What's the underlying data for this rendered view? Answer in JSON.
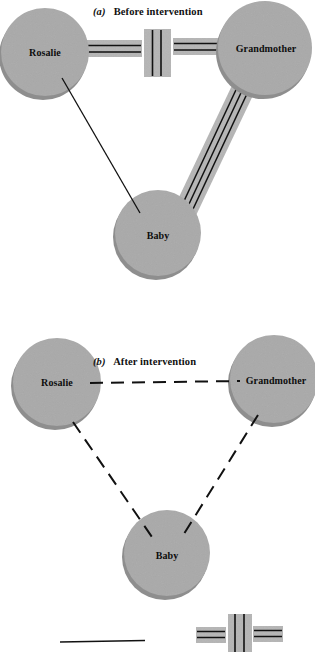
{
  "figure": {
    "background_color": "#ffffff",
    "node_fill_color": "#a9a9a9",
    "node_shadow_color": "#8e8e8e",
    "band_fill_color": "#b5b5b5",
    "line_color": "#111111"
  },
  "panels": [
    {
      "id": "before",
      "caption_letter": "(a)",
      "caption_text": "Before intervention",
      "nodes": [
        {
          "name": "rosalie",
          "label": "Rosalie",
          "cx": 45,
          "cy": 52,
          "r": 44
        },
        {
          "name": "grandmother",
          "label": "Grandmother",
          "cx": 265,
          "cy": 48,
          "r": 47
        },
        {
          "name": "baby",
          "label": "Baby",
          "cx": 158,
          "cy": 233,
          "r": 43
        }
      ],
      "relationships": [
        {
          "name": "rosalie-grandmother",
          "from": "rosalie",
          "to": "grandmother",
          "type": "conflict-double-line-with-barrier",
          "description": "double parallel lines on a gray band interrupted by a vertical barrier"
        },
        {
          "name": "grandmother-baby",
          "from": "grandmother",
          "to": "baby",
          "type": "overinvolved-triple-line",
          "description": "three parallel lines on a gray band"
        },
        {
          "name": "rosalie-baby",
          "from": "rosalie",
          "to": "baby",
          "type": "normal-single-line",
          "description": "plain thin solid line"
        }
      ]
    },
    {
      "id": "after",
      "caption_letter": "(b)",
      "caption_text": "After intervention",
      "nodes": [
        {
          "name": "rosalie",
          "label": "Rosalie",
          "cx": 57,
          "cy": 82,
          "r": 44
        },
        {
          "name": "grandmother",
          "label": "Grandmother",
          "cx": 274,
          "cy": 79,
          "r": 44
        },
        {
          "name": "baby",
          "label": "Baby",
          "cx": 167,
          "cy": 253,
          "r": 43
        }
      ],
      "relationships": [
        {
          "name": "rosalie-grandmother",
          "from": "rosalie",
          "to": "grandmother",
          "type": "dashed-line",
          "description": "long dashed line"
        },
        {
          "name": "rosalie-baby",
          "from": "rosalie",
          "to": "baby",
          "type": "dashed-line",
          "description": "long dashed line"
        },
        {
          "name": "grandmother-baby",
          "from": "grandmother",
          "to": "baby",
          "type": "dashed-line",
          "description": "long dashed line"
        }
      ]
    }
  ],
  "legend": {
    "items": [
      {
        "name": "normal-relationship",
        "symbol": "solid-line",
        "label": ""
      },
      {
        "name": "conflict-relationship",
        "symbol": "double-line-with-vertical-barrier",
        "label": ""
      }
    ]
  }
}
